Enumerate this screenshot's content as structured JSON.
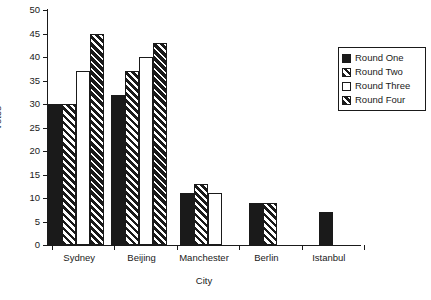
{
  "chart_data": {
    "type": "bar",
    "title": "",
    "xlabel": "City",
    "ylabel": "Votes",
    "categories": [
      "Sydney",
      "Beijing",
      "Manchester",
      "Berlin",
      "Istanbul"
    ],
    "series": [
      {
        "name": "Round One",
        "key": "r1",
        "fill": "solid-black",
        "values": [
          30,
          32,
          11,
          9,
          7
        ]
      },
      {
        "name": "Round Two",
        "key": "r2",
        "fill": "diagonal-hatch",
        "values": [
          30,
          37,
          13,
          9,
          null
        ]
      },
      {
        "name": "Round Three",
        "key": "r3",
        "fill": "white",
        "values": [
          37,
          40,
          11,
          null,
          null
        ]
      },
      {
        "name": "Round Four",
        "key": "r4",
        "fill": "dense-diagonal-hatch",
        "values": [
          45,
          43,
          null,
          null,
          null
        ]
      }
    ],
    "ylim": [
      0,
      50
    ],
    "ytick_values": [
      0,
      5,
      10,
      15,
      20,
      25,
      30,
      35,
      40,
      45,
      50
    ],
    "ytick_labels": [
      "0",
      "5",
      "10",
      "15",
      "20",
      "25",
      "30",
      "35",
      "40",
      "45",
      "50"
    ],
    "grid": false,
    "legend_position": "right",
    "colors": {
      "bar_dark": "#1a1a1a",
      "bar_light": "#ffffff",
      "axis": "#1a1a1a",
      "background": "#ffffff"
    }
  }
}
